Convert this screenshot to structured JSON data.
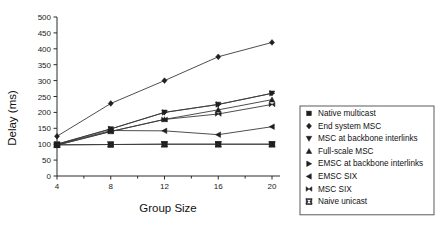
{
  "chart_data": {
    "type": "line",
    "title": "",
    "xlabel": "Group Size",
    "ylabel": "Delay (ms)",
    "x": [
      4,
      8,
      12,
      16,
      20
    ],
    "xlim": [
      4,
      20
    ],
    "ylim": [
      0,
      500
    ],
    "xticks": [
      "4",
      "8",
      "12",
      "16",
      "20"
    ],
    "yticks": [
      "0",
      "50",
      "100",
      "150",
      "200",
      "250",
      "300",
      "350",
      "400",
      "450",
      "500"
    ],
    "grid": false,
    "legend_position": "right",
    "series": [
      {
        "name": "Native multicast",
        "marker": "square",
        "values": [
          98,
          99,
          100,
          100,
          100
        ]
      },
      {
        "name": "End system MSC",
        "marker": "diamond",
        "values": [
          125,
          228,
          300,
          375,
          420
        ]
      },
      {
        "name": "MSC at backbone interlinks",
        "marker": "triangle-down",
        "values": [
          100,
          148,
          200,
          225,
          260
        ]
      },
      {
        "name": "Full-scale MSC",
        "marker": "triangle-up",
        "values": [
          97,
          140,
          178,
          208,
          240
        ]
      },
      {
        "name": "EMSC at backbone interlinks",
        "marker": "triangle-right",
        "values": [
          100,
          148,
          200,
          225,
          260
        ]
      },
      {
        "name": "EMSC SIX",
        "marker": "triangle-left",
        "values": [
          99,
          143,
          142,
          130,
          155
        ]
      },
      {
        "name": "MSC SIX",
        "marker": "bowtie",
        "values": [
          97,
          140,
          178,
          195,
          225
        ]
      },
      {
        "name": "Naive unicast",
        "marker": "x-bar",
        "values": [
          98,
          99,
          100,
          100,
          100
        ]
      }
    ]
  },
  "legend": {
    "items": [
      "Native multicast",
      "End system MSC",
      "MSC at backbone interlinks",
      "Full-scale MSC",
      "EMSC at backbone interlinks",
      "EMSC SIX",
      "MSC SIX",
      "Naive unicast"
    ]
  }
}
